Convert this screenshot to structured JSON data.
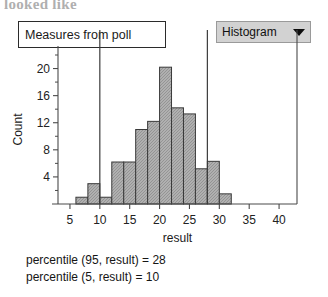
{
  "page": {
    "cut_off_top_text": "looked like"
  },
  "title_box": {
    "label": "Measures from poll"
  },
  "plot_type_dropdown": {
    "label": "Histogram",
    "caret_icon": "chevron-down-icon"
  },
  "annotations": [
    "percentile (95, result) = 28",
    "percentile (5, result) = 10"
  ],
  "colors": {
    "bar_fill": "#b0b0b0",
    "bar_stroke": "#3a3a3a",
    "axis": "#4a4a4a",
    "dropdown_bg": "#d2d2d2",
    "refline": "#3c3c3c"
  },
  "chart_data": {
    "type": "bar",
    "title": "",
    "xlabel": "result",
    "ylabel": "Count",
    "xlim": [
      3,
      43
    ],
    "ylim": [
      0,
      22
    ],
    "xticks": [
      5,
      10,
      15,
      20,
      25,
      30,
      35,
      40
    ],
    "yticks": [
      4,
      8,
      12,
      16,
      20
    ],
    "yticks_minor": [
      2,
      6,
      10,
      14,
      18,
      22
    ],
    "grid": false,
    "legend": "none",
    "bin_width": 2,
    "bin_starts": [
      6,
      8,
      10,
      12,
      14,
      16,
      18,
      20,
      22,
      24,
      26,
      28,
      30
    ],
    "categories": [
      "6-8",
      "8-10",
      "10-12",
      "12-14",
      "14-16",
      "16-18",
      "18-20",
      "20-22",
      "22-24",
      "24-26",
      "26-28",
      "28-30",
      "30-32"
    ],
    "values": [
      1,
      3,
      1,
      6.2,
      6.2,
      11,
      12.2,
      20.2,
      14.2,
      13.3,
      5.2,
      6.3,
      1.5
    ],
    "reference_lines": [
      {
        "name": "percentile-5",
        "x": 10
      },
      {
        "name": "percentile-28",
        "x": 28
      }
    ]
  }
}
